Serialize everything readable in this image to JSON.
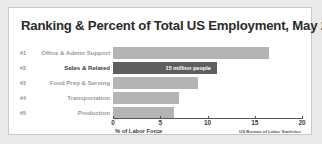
{
  "chart_data": {
    "type": "bar",
    "orientation": "horizontal",
    "title": "Ranking & Percent of Total US Employment, May 2014",
    "xlabel": "% of Labor Force",
    "ylabel": "",
    "xlim": [
      0,
      20
    ],
    "xticks": [
      0,
      5,
      10,
      15,
      20
    ],
    "xtick_labels": [
      "0",
      "5",
      "10",
      "15",
      "20"
    ],
    "grid": false,
    "legend": null,
    "source": "US Bureau of Labor Statistics",
    "categories": [
      "Office & Admin Support",
      "Sales & Related",
      "Food Prep & Serving",
      "Transportation",
      "Production"
    ],
    "ranks": [
      "#1",
      "#2",
      "#3",
      "#4",
      "#5"
    ],
    "values": [
      16.5,
      11.0,
      9.0,
      7.0,
      6.5
    ],
    "bars": [
      {
        "rank": "#1",
        "category": "Office & Admin Support",
        "value": 16.5,
        "highlighted": false,
        "annotation": "",
        "color": "#b4b4b4"
      },
      {
        "rank": "#2",
        "category": "Sales & Related",
        "value": 11.0,
        "highlighted": true,
        "annotation": "15 million people",
        "color": "#5e5e5e"
      },
      {
        "rank": "#3",
        "category": "Food Prep & Serving",
        "value": 9.0,
        "highlighted": false,
        "annotation": "",
        "color": "#b4b4b4"
      },
      {
        "rank": "#4",
        "category": "Transportation",
        "value": 7.0,
        "highlighted": false,
        "annotation": "",
        "color": "#b4b4b4"
      },
      {
        "rank": "#5",
        "category": "Production",
        "value": 6.5,
        "highlighted": false,
        "annotation": "",
        "color": "#b4b4b4"
      }
    ],
    "colors": {
      "bar_default": "#b4b4b4",
      "bar_highlight": "#5e5e5e",
      "axis": "#555555",
      "title_text": "#2b2b2b",
      "label_text": "#9a9a9a",
      "panel_background": "#ffffff",
      "outer_background": "#e9e9e9"
    }
  }
}
